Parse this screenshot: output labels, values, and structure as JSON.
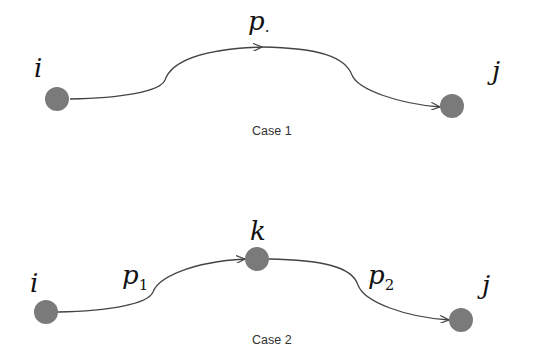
{
  "case1": {
    "caption": "Case 1",
    "nodes": [
      {
        "id": "i",
        "label": "i",
        "cx": 57,
        "cy": 99
      },
      {
        "id": "j",
        "label": "j",
        "cx": 452,
        "cy": 106
      }
    ],
    "path_label": "p",
    "path_label_sub": "·"
  },
  "case2": {
    "caption": "Case 2",
    "nodes": [
      {
        "id": "i",
        "label": "i",
        "cx": 46,
        "cy": 312
      },
      {
        "id": "k",
        "label": "k",
        "cx": 257,
        "cy": 259
      },
      {
        "id": "j",
        "label": "j",
        "cx": 461,
        "cy": 320
      }
    ],
    "path1_label": "p",
    "path1_sub": "1",
    "path2_label": "p",
    "path2_sub": "2"
  },
  "colors": {
    "node": "#7a7a7a",
    "edge": "#444444"
  }
}
